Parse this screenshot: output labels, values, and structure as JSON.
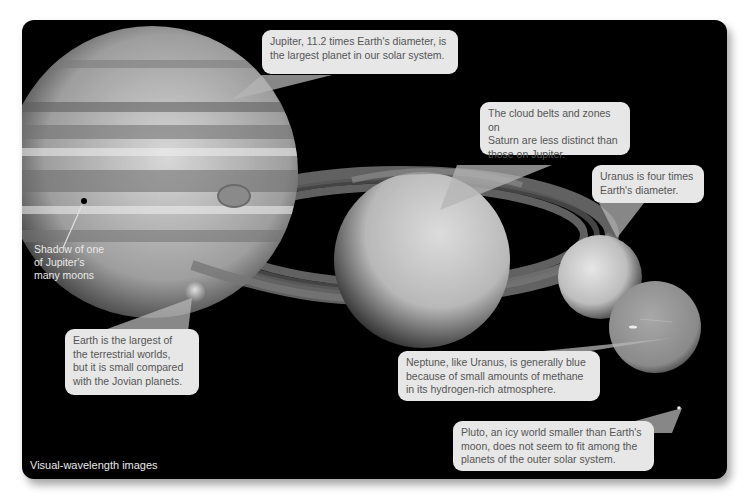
{
  "figure": {
    "caption": "Visual-wavelength images",
    "colors": {
      "background": "#000000",
      "callout_fill": "#e7e7e7",
      "callout_text": "#555555",
      "pointer_fill": "#9a9a9a",
      "label_text": "#eaeaea"
    }
  },
  "planets": [
    {
      "name": "Jupiter",
      "callout": "Jupiter, 11.2 times Earth's diameter, is the largest planet in our solar system.",
      "lines": [
        "Jupiter, 11.2 times Earth's diameter, is",
        "the largest planet in our solar system."
      ]
    },
    {
      "name": "Saturn",
      "callout": "The cloud belts and zones on Saturn are less distinct than those on Jupiter.",
      "lines": [
        "The cloud belts and zones on",
        "Saturn are less distinct than",
        "those on Jupiter."
      ]
    },
    {
      "name": "Uranus",
      "callout": "Uranus is four times Earth's diameter.",
      "lines": [
        "Uranus is four times",
        "Earth's diameter."
      ]
    },
    {
      "name": "Earth",
      "callout": "Earth is the largest of the terrestrial worlds, but it is small compared with the Jovian planets.",
      "lines": [
        "Earth is the largest of",
        "the terrestrial worlds,",
        "but it is small compared",
        "with the Jovian planets."
      ]
    },
    {
      "name": "Neptune",
      "callout": "Neptune, like Uranus, is generally blue because of small amounts of methane in its hydrogen-rich atmosphere.",
      "lines": [
        "Neptune, like Uranus, is generally blue",
        "because of small amounts of methane",
        "in its hydrogen-rich atmosphere."
      ]
    },
    {
      "name": "Pluto",
      "callout": "Pluto, an icy world smaller than Earth's moon, does not seem to fit among the planets of the outer solar system.",
      "lines": [
        "Pluto, an icy world smaller than Earth's",
        "moon, does not seem to fit among the",
        "planets of the outer solar system."
      ]
    }
  ],
  "annotations": {
    "moon_shadow": {
      "lines": [
        "Shadow of one",
        "of Jupiter's",
        "many moons"
      ]
    }
  }
}
